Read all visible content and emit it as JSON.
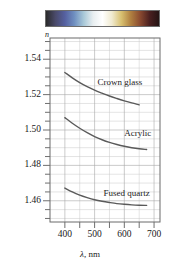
{
  "figure": {
    "axis_label_y": "n",
    "axis_label_x_symbol": "λ",
    "axis_label_x_unit": ", nm",
    "spectrum_bar": {
      "name": "visible-spectrum-bar",
      "colors": [
        "#2a2a2a",
        "#4a4a6a",
        "#5560a0",
        "#6f8fc0",
        "#a8c8d8",
        "#e8eef0",
        "#ffffff",
        "#f0ead0",
        "#d8c070",
        "#b08040",
        "#8a4a30",
        "#4a2020",
        "#241414"
      ]
    }
  },
  "chart_data": {
    "type": "line",
    "title": "",
    "xlabel": "λ, nm",
    "ylabel": "n",
    "xlim": [
      350,
      720
    ],
    "ylim": [
      1.448,
      1.552
    ],
    "grid": true,
    "legend_position": "inline-annotation",
    "xticks": [
      400,
      500,
      600,
      700
    ],
    "xtick_labels": [
      "400",
      "500",
      "600",
      "700"
    ],
    "yticks": [
      1.46,
      1.48,
      1.5,
      1.52,
      1.54
    ],
    "ytick_labels": [
      "1.46",
      "1.48",
      "1.50",
      "1.52",
      "1.54"
    ],
    "x_minor_step": 50,
    "y_minor_step": 0.005,
    "series": [
      {
        "name": "Crown glass",
        "color": "#5a5a5a",
        "x": [
          400,
          425,
          450,
          475,
          500,
          525,
          550,
          575,
          600,
          625,
          650
        ],
        "values": [
          1.5325,
          1.5295,
          1.5268,
          1.5245,
          1.5225,
          1.5208,
          1.5192,
          1.5178,
          1.5165,
          1.5153,
          1.5142
        ]
      },
      {
        "name": "Acrylic",
        "color": "#5a5a5a",
        "x": [
          400,
          425,
          450,
          475,
          500,
          525,
          550,
          575,
          600,
          625,
          650,
          675
        ],
        "values": [
          1.507,
          1.5038,
          1.501,
          1.4985,
          1.4963,
          1.4945,
          1.493,
          1.4918,
          1.4908,
          1.49,
          1.4894,
          1.489
        ]
      },
      {
        "name": "Fused quartz",
        "color": "#5a5a5a",
        "x": [
          400,
          425,
          450,
          475,
          500,
          525,
          550,
          575,
          600,
          625,
          650,
          675
        ],
        "values": [
          1.4672,
          1.465,
          1.4632,
          1.4618,
          1.4606,
          1.4597,
          1.459,
          1.4584,
          1.458,
          1.4577,
          1.4575,
          1.4574
        ]
      }
    ],
    "annotations": [
      {
        "text": "Crown glass",
        "x": 510,
        "y": 1.5265
      },
      {
        "text": "Acrylic",
        "x": 600,
        "y": 1.4975
      },
      {
        "text": "Fused quartz",
        "x": 530,
        "y": 1.464
      }
    ]
  }
}
